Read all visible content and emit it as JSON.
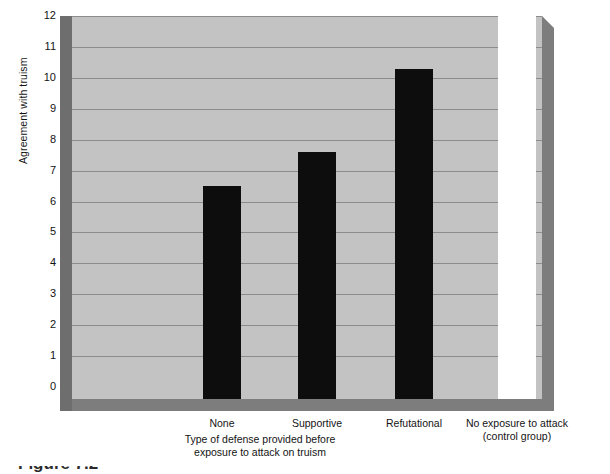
{
  "chart_data": {
    "type": "bar",
    "title": "",
    "subtitle": "",
    "xlabel": "Type of defense provided before exposure to attack on truism",
    "xlabel_lines": [
      "Type of defense provided before",
      "exposure to attack on truism"
    ],
    "ylabel": "Agreement with truism",
    "ylim": [
      0,
      12
    ],
    "ytick_labels": [
      "12",
      "11",
      "10",
      "9",
      "8",
      "7",
      "6",
      "5",
      "4",
      "3",
      "2",
      "1",
      "0"
    ],
    "ytick_values": [
      12,
      11,
      10,
      9,
      8,
      7,
      6,
      5,
      4,
      3,
      2,
      1,
      0
    ],
    "grid": true,
    "legend": "none",
    "categories": [
      "None",
      "Supportive",
      "Refutational",
      "No exposure to attack (control group)"
    ],
    "category_lines": [
      [
        "None"
      ],
      [
        "Supportive"
      ],
      [
        "Refutational"
      ],
      [
        "No exposure to attack",
        "(control group)"
      ]
    ],
    "values": [
      6.5,
      7.6,
      10.3,
      12.4
    ],
    "bars": [
      {
        "label": "None",
        "value": 6.5,
        "color": "#0d0d0d"
      },
      {
        "label": "Supportive",
        "value": 7.6,
        "color": "#0d0d0d"
      },
      {
        "label": "Refutational",
        "value": 10.3,
        "color": "#0d0d0d"
      },
      {
        "label": "No exposure to attack (control group)",
        "value": 12.4,
        "color": "#ffffff"
      }
    ]
  },
  "style": {
    "plot_background": "#c3c3c3",
    "gridline_color": "#8c8c8c",
    "bevel_light": "#7d7d7d",
    "bevel_dark": "#6e6e6e",
    "bar_dark": "#0d0d0d",
    "bar_light": "#ffffff",
    "page_background": "#ffffff",
    "text_color": "#141414"
  },
  "caption": {
    "text": "Figure 7.2"
  }
}
